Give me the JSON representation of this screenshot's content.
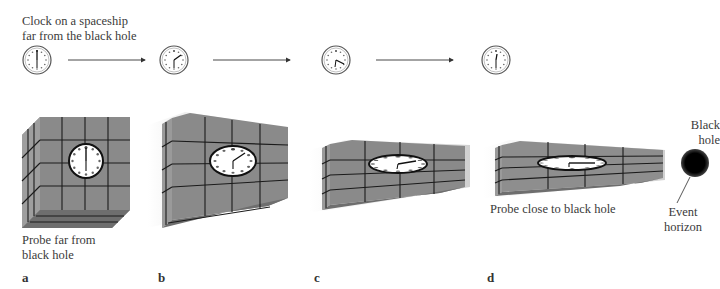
{
  "title_label": {
    "line1": "Clock on a spaceship",
    "line2": "far from the black hole"
  },
  "probe_far_label": {
    "line1": "Probe far from",
    "line2": "black hole"
  },
  "probe_close_label": "Probe close to black hole",
  "black_hole_label": {
    "line1": "Black",
    "line2": "hole"
  },
  "event_horizon_label": {
    "line1": "Event",
    "line2": "horizon"
  },
  "panels": [
    {
      "letter": "a",
      "spaceship_clock_time": "12:00",
      "probe_clock_time": "12:00"
    },
    {
      "letter": "b",
      "spaceship_clock_time": "~1:10",
      "probe_clock_time": "~1:10"
    },
    {
      "letter": "c",
      "spaceship_clock_time": "~4:20",
      "probe_clock_time": "~2:15"
    },
    {
      "letter": "d",
      "spaceship_clock_time": "~6:25",
      "probe_clock_time": "~3:30"
    }
  ],
  "colors": {
    "probe_face": "#8a8a8a",
    "probe_side": "#9a9a9a",
    "grid_line": "#1a1a1a",
    "black_hole": "#000000",
    "arrow": "#333333"
  }
}
